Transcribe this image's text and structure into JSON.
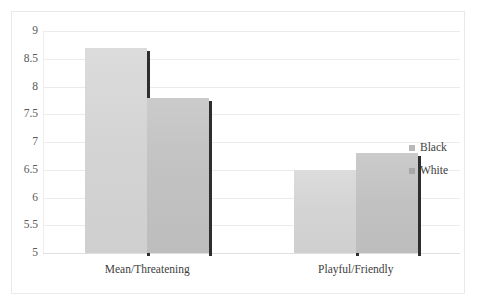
{
  "chart_data": {
    "type": "bar",
    "title": "",
    "subtitle": "",
    "xlabel": "",
    "ylabel": "",
    "categories": [
      "Mean/Threatening",
      "Playful/Friendly"
    ],
    "series": [
      {
        "name": "Black",
        "values": [
          8.7,
          6.5
        ],
        "color": "#d4d4d4"
      },
      {
        "name": "White",
        "values": [
          7.8,
          6.8
        ],
        "color": "#c2c2c2"
      }
    ],
    "ylim": [
      5,
      9
    ],
    "ytick_step": 0.5,
    "ytick_labels": [
      "5",
      "5.5",
      "6",
      "6.5",
      "7",
      "7.5",
      "8",
      "8.5",
      "9"
    ],
    "ytick_values": [
      5,
      5.5,
      6,
      6.5,
      7,
      7.5,
      8,
      8.5,
      9
    ],
    "grid": true,
    "grid_axis": "y",
    "legend_position": "right",
    "bar_mode": "grouped",
    "frame": true
  },
  "legend": {
    "entries": [
      {
        "label": "Black",
        "swatch": "series-black-swatch"
      },
      {
        "label": "White",
        "swatch": "series-white-swatch"
      }
    ]
  }
}
